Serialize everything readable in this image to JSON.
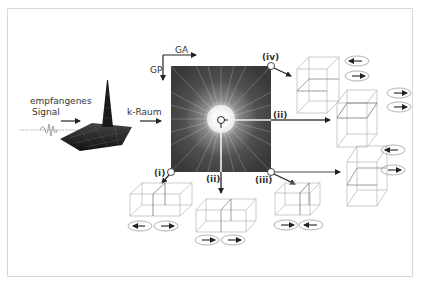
{
  "figure": {
    "labels": {
      "signal_line1": "empfangenes",
      "signal_line2": "Signal",
      "kspace": "k-Raum",
      "ga": "GA",
      "gp": "GP"
    },
    "positions": [
      {
        "id": "i",
        "label": "(i)"
      },
      {
        "id": "ii_center_right",
        "label": "(ii)"
      },
      {
        "id": "ii_center_down",
        "label": "(ii)"
      },
      {
        "id": "iii",
        "label": "(iii)"
      },
      {
        "id": "iv",
        "label": "(iv)"
      }
    ],
    "gradient_arrows": {
      "i": [
        "left",
        "right"
      ],
      "ii_bottom": [
        "right",
        "right"
      ],
      "iii": [
        "right",
        "left"
      ],
      "iv": [
        "left",
        "right"
      ],
      "ii_right": [
        "right",
        "right"
      ],
      "iii_right": [
        "left",
        "right"
      ]
    },
    "colors": {
      "frame": "#d8d8d8",
      "text": "#333333",
      "arrow": "#222222",
      "box_line": "#b0b0b0",
      "ellipse": "#a0a0a0",
      "kspace_dark": "#3a3a3a",
      "kspace_center": "#ffffff"
    }
  }
}
